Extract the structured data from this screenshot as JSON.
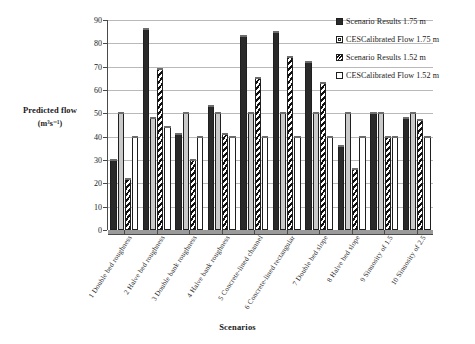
{
  "chart_data": {
    "type": "bar",
    "title": "",
    "xlabel": "Scenarios",
    "ylabel": "Predicted flow",
    "ylabel_unit": "(m³s⁻¹)",
    "ylim": [
      0,
      90
    ],
    "ytick_step": 10,
    "yticks": [
      0,
      10,
      20,
      30,
      40,
      50,
      60,
      70,
      80,
      90
    ],
    "grid": true,
    "legend_position": "top-right",
    "categories": [
      "1 Double bed roughness",
      "2 Halve bed roughness",
      "3 Double bank roughness",
      "4 Halve bank roughness",
      "5 Concrete-lined channel",
      "6 Concrete-lined rectangular",
      "7 Double bed slope",
      "8 Halve bed slope",
      "9 Sinuosity of 1.5",
      "10 Sinuosity of 2.5"
    ],
    "series": [
      {
        "name": "Scenario Results 1.75 m",
        "fill": "solid-dark",
        "color": "#2a2a2a",
        "values": [
          30,
          86,
          41,
          53,
          83,
          85,
          72,
          36,
          50,
          48
        ]
      },
      {
        "name": "CESCalibrated Flow 1.75 m",
        "fill": "solid-gray",
        "color": "#c9c9c9",
        "values": [
          50,
          48,
          50,
          50,
          50,
          50,
          50,
          50,
          50,
          50
        ]
      },
      {
        "name": "Scenario Results 1.52 m",
        "fill": "diagonal-hatch",
        "color": "#111111",
        "values": [
          22,
          69,
          30,
          41,
          65,
          74,
          63,
          26,
          40,
          47
        ]
      },
      {
        "name": "CESCalibrated Flow 1.52 m",
        "fill": "white",
        "color": "#ffffff",
        "values": [
          40,
          44,
          40,
          40,
          40,
          40,
          40,
          40,
          40,
          40
        ]
      }
    ]
  },
  "legend": {
    "items": [
      {
        "label": "Scenario Results 1.75 m",
        "swatch": "solid-dark-swatch"
      },
      {
        "label": "CESCalibrated Flow 1.75 m",
        "swatch": "solid-gray-swatch"
      },
      {
        "label": "Scenario Results 1.52 m",
        "swatch": "hatch-swatch"
      },
      {
        "label": "CESCalibrated Flow 1.52 m",
        "swatch": "white-swatch"
      }
    ]
  }
}
